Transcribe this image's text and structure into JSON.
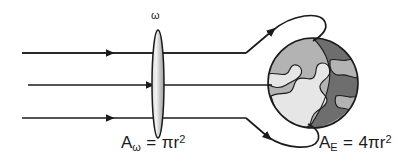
{
  "figure": {
    "background_color": "#ffffff",
    "stroke_color": "#1b1b1b"
  },
  "lens": {
    "symbol": "ω",
    "symbol_name": "omega",
    "fill_light": "#f2f2f2",
    "fill_mid": "#b9b9b9",
    "center_x": 158,
    "center_y": 84,
    "rx": 6,
    "ry": 54
  },
  "labels": {
    "lens_area": {
      "base": "A",
      "subscript": "ω",
      "equals": " = ",
      "value": "πr",
      "exponent": "2"
    },
    "earth_area": {
      "base": "A",
      "subscript": "E",
      "equals": " = ",
      "value": "4πr",
      "exponent": "2"
    }
  },
  "rays": [
    {
      "name": "top-ray",
      "y": 53,
      "x_start": 22,
      "x_bend": 246,
      "behavior": "bends-up-and-wraps-over-globe"
    },
    {
      "name": "middle-ray",
      "y": 85,
      "x_start": 28,
      "x_end": 272,
      "behavior": "straight-into-globe"
    },
    {
      "name": "bottom-ray",
      "y": 118,
      "x_start": 22,
      "x_bend": 246,
      "behavior": "bends-down-and-wraps-under-globe"
    }
  ],
  "globe": {
    "name": "earth-sphere",
    "center_x": 313,
    "center_y": 83,
    "radius": 45,
    "ocean_day_color": "#b3b3b3",
    "land_color": "#e6e6e6",
    "night_color": "#6e6e6e",
    "outline_color": "#1b1b1b"
  }
}
